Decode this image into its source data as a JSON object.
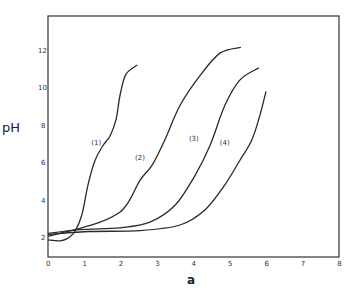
{
  "chart_data": {
    "type": "line",
    "title": "",
    "xlabel": "a",
    "ylabel": "pH",
    "xlim": [
      0,
      8
    ],
    "ylim": [
      1.04,
      13.9
    ],
    "grid": false,
    "legend": "inline labels on curves",
    "x_ticks": [
      "0",
      "1",
      "2",
      "3",
      "4",
      "5",
      "6",
      "7",
      "8"
    ],
    "y_ticks": [
      "2",
      "4",
      "6",
      "8",
      "10",
      "12"
    ],
    "series": [
      {
        "name": "(1)",
        "label_pos": [
          1.52,
          7.1
        ],
        "points": [
          [
            0,
            1.95
          ],
          [
            0.33,
            1.9
          ],
          [
            0.55,
            2.05
          ],
          [
            0.74,
            2.4
          ],
          [
            0.93,
            3.3
          ],
          [
            1.1,
            4.9
          ],
          [
            1.29,
            6.2
          ],
          [
            1.51,
            7.0
          ],
          [
            1.7,
            7.5
          ],
          [
            1.87,
            8.4
          ],
          [
            1.98,
            9.7
          ],
          [
            2.14,
            10.8
          ],
          [
            2.45,
            11.3
          ]
        ]
      },
      {
        "name": "(2)",
        "label_pos": [
          2.72,
          6.3
        ],
        "points": [
          [
            0,
            2.15
          ],
          [
            0.74,
            2.5
          ],
          [
            1.43,
            2.9
          ],
          [
            1.98,
            3.45
          ],
          [
            2.25,
            4.1
          ],
          [
            2.53,
            5.15
          ],
          [
            2.86,
            5.95
          ],
          [
            3.21,
            7.3
          ],
          [
            3.63,
            9.15
          ],
          [
            4.18,
            10.75
          ],
          [
            4.73,
            11.95
          ],
          [
            5.3,
            12.25
          ]
        ]
      },
      {
        "name": "(3)",
        "label_pos": [
          4.2,
          7.3
        ],
        "points": [
          [
            0,
            2.3
          ],
          [
            0.88,
            2.5
          ],
          [
            1.98,
            2.6
          ],
          [
            2.8,
            2.9
          ],
          [
            3.49,
            3.8
          ],
          [
            4.04,
            5.4
          ],
          [
            4.45,
            7.0
          ],
          [
            4.86,
            9.15
          ],
          [
            5.27,
            10.5
          ],
          [
            5.79,
            11.15
          ]
        ]
      },
      {
        "name": "(4)",
        "label_pos": [
          5.05,
          7.1
        ],
        "points": [
          [
            0,
            2.25
          ],
          [
            1.15,
            2.4
          ],
          [
            2.53,
            2.45
          ],
          [
            3.63,
            2.75
          ],
          [
            4.31,
            3.55
          ],
          [
            4.86,
            4.9
          ],
          [
            5.27,
            6.2
          ],
          [
            5.6,
            7.3
          ],
          [
            5.82,
            8.6
          ],
          [
            5.99,
            9.9
          ]
        ]
      }
    ]
  },
  "labels": {
    "xlabel": "a",
    "ylabel": "pH"
  }
}
